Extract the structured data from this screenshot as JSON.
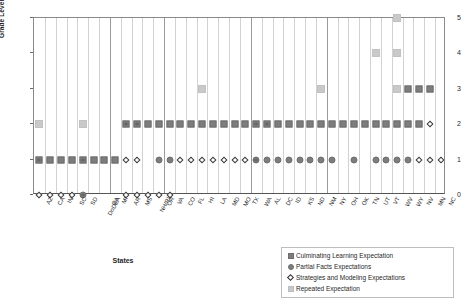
{
  "chart_data": {
    "type": "scatter",
    "title": "",
    "xlabel": "States",
    "ylabel": "Grade Level (0 = Kindergarten)",
    "ylim": [
      0,
      5
    ],
    "yticks": [
      "0",
      "1",
      "2",
      "3",
      "4",
      "5"
    ],
    "grid": true,
    "legend_position": "bottom-right",
    "categories": [
      "AZ",
      "CA",
      "IN",
      "SC",
      "SD",
      "DoDEA",
      "GA",
      "MI",
      "AR",
      "MS",
      "NH/RI",
      "OR",
      "VA",
      "CO",
      "FL",
      "HI",
      "LA",
      "MD",
      "MO",
      "TX",
      "WA",
      "AL",
      "DC",
      "ID",
      "KS",
      "ND",
      "NM",
      "NY",
      "OH",
      "OK",
      "TN",
      "UT",
      "VT",
      "WV",
      "WY",
      "NV",
      "MN",
      "NC"
    ],
    "series": [
      {
        "name": "Culminating Learning Expectation",
        "marker": "dark-square",
        "color": "#7d7d7d",
        "points": [
          {
            "x": "AZ",
            "y": 1
          },
          {
            "x": "CA",
            "y": 1
          },
          {
            "x": "IN",
            "y": 1
          },
          {
            "x": "SC",
            "y": 1
          },
          {
            "x": "SD",
            "y": 1
          },
          {
            "x": "DoDEA",
            "y": 1
          },
          {
            "x": "GA",
            "y": 1
          },
          {
            "x": "MI",
            "y": 1
          },
          {
            "x": "AR",
            "y": 2
          },
          {
            "x": "MS",
            "y": 2
          },
          {
            "x": "NH/RI",
            "y": 2
          },
          {
            "x": "OR",
            "y": 2
          },
          {
            "x": "VA",
            "y": 2
          },
          {
            "x": "CO",
            "y": 2
          },
          {
            "x": "FL",
            "y": 2
          },
          {
            "x": "HI",
            "y": 2
          },
          {
            "x": "LA",
            "y": 2
          },
          {
            "x": "MD",
            "y": 2
          },
          {
            "x": "MO",
            "y": 2
          },
          {
            "x": "TX",
            "y": 2
          },
          {
            "x": "WA",
            "y": 2
          },
          {
            "x": "AL",
            "y": 2
          },
          {
            "x": "DC",
            "y": 2
          },
          {
            "x": "ID",
            "y": 2
          },
          {
            "x": "KS",
            "y": 2
          },
          {
            "x": "ND",
            "y": 2
          },
          {
            "x": "NM",
            "y": 2
          },
          {
            "x": "NY",
            "y": 2
          },
          {
            "x": "OH",
            "y": 2
          },
          {
            "x": "OK",
            "y": 2
          },
          {
            "x": "TN",
            "y": 2
          },
          {
            "x": "UT",
            "y": 2
          },
          {
            "x": "VT",
            "y": 2
          },
          {
            "x": "WV",
            "y": 2
          },
          {
            "x": "WY",
            "y": 2
          },
          {
            "x": "NV",
            "y": 2
          },
          {
            "x": "WY",
            "y": 3
          },
          {
            "x": "NV",
            "y": 3
          },
          {
            "x": "MN",
            "y": 3
          }
        ]
      },
      {
        "name": "Partial Facts Expectations",
        "marker": "dark-circle",
        "color": "#7d7d7d",
        "points": [
          {
            "x": "SD",
            "y": 0
          },
          {
            "x": "OR",
            "y": 1
          },
          {
            "x": "VA",
            "y": 1
          },
          {
            "x": "WA",
            "y": 1
          },
          {
            "x": "AL",
            "y": 1
          },
          {
            "x": "DC",
            "y": 1
          },
          {
            "x": "ID",
            "y": 1
          },
          {
            "x": "KS",
            "y": 1
          },
          {
            "x": "ND",
            "y": 1
          },
          {
            "x": "NM",
            "y": 1
          },
          {
            "x": "NY",
            "y": 1
          },
          {
            "x": "OK",
            "y": 1
          },
          {
            "x": "UT",
            "y": 1
          },
          {
            "x": "VT",
            "y": 1
          },
          {
            "x": "WV",
            "y": 1
          },
          {
            "x": "WY",
            "y": 1
          }
        ]
      },
      {
        "name": "Strategies and Modeling Expectations",
        "marker": "open-diamond",
        "color": "#2e2e2e",
        "points": [
          {
            "x": "AZ",
            "y": 0
          },
          {
            "x": "CA",
            "y": 0
          },
          {
            "x": "IN",
            "y": 0
          },
          {
            "x": "SC",
            "y": 0
          },
          {
            "x": "SD",
            "y": 0
          },
          {
            "x": "AR",
            "y": 0
          },
          {
            "x": "MS",
            "y": 0
          },
          {
            "x": "NH/RI",
            "y": 0
          },
          {
            "x": "OR",
            "y": 0
          },
          {
            "x": "VA",
            "y": 0
          },
          {
            "x": "AZ",
            "y": 1
          },
          {
            "x": "SD",
            "y": 1
          },
          {
            "x": "AR",
            "y": 1
          },
          {
            "x": "MS",
            "y": 1
          },
          {
            "x": "CO",
            "y": 1
          },
          {
            "x": "FL",
            "y": 1
          },
          {
            "x": "HI",
            "y": 1
          },
          {
            "x": "LA",
            "y": 1
          },
          {
            "x": "MD",
            "y": 1
          },
          {
            "x": "MO",
            "y": 1
          },
          {
            "x": "TX",
            "y": 1
          },
          {
            "x": "WA",
            "y": 1
          },
          {
            "x": "NV",
            "y": 1
          },
          {
            "x": "MN",
            "y": 1
          },
          {
            "x": "NC",
            "y": 1
          },
          {
            "x": "AR",
            "y": 2
          },
          {
            "x": "MS",
            "y": 2
          },
          {
            "x": "WA",
            "y": 2
          },
          {
            "x": "AL",
            "y": 2
          },
          {
            "x": "MN",
            "y": 2
          }
        ]
      },
      {
        "name": "Repeated Expectation",
        "marker": "light-square",
        "color": "#c9c9c9",
        "points": [
          {
            "x": "AZ",
            "y": 2
          },
          {
            "x": "SD",
            "y": 2
          },
          {
            "x": "HI",
            "y": 3
          },
          {
            "x": "NM",
            "y": 3
          },
          {
            "x": "WV",
            "y": 3
          },
          {
            "x": "UT",
            "y": 4
          },
          {
            "x": "WV",
            "y": 4
          },
          {
            "x": "WV",
            "y": 5
          }
        ]
      }
    ]
  },
  "axis": {
    "y_title": "Grade Level (0 = Kindergarten)",
    "x_title": "States"
  },
  "legend": {
    "items": [
      {
        "label": "Culminating Learning Expectation",
        "marker": "dark-square"
      },
      {
        "label": "Partial Facts Expectations",
        "marker": "dark-circle"
      },
      {
        "label": "Strategies and Modeling Expectations",
        "marker": "open-diamond"
      },
      {
        "label": "Repeated Expectation",
        "marker": "light-square"
      }
    ]
  }
}
